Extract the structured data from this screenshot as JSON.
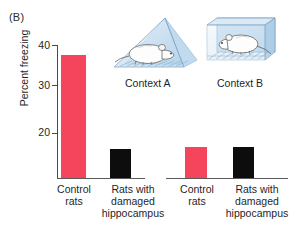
{
  "panel": {
    "label": "(B)"
  },
  "chart_data": {
    "type": "bar",
    "title": "",
    "subtitle": "",
    "xlabel": "",
    "ylabel": "Percent freezing",
    "ylim": [
      14,
      42
    ],
    "yticks": [
      20,
      30,
      40
    ],
    "ytick_labels": [
      "20",
      "30",
      "40"
    ],
    "grid": false,
    "legend": "none",
    "groups": [
      {
        "name": "Context A",
        "label": "Context A"
      },
      {
        "name": "Context B",
        "label": "Context B"
      }
    ],
    "categories": [
      "Control rats",
      "Rats with damaged hippocampus"
    ],
    "series": [
      {
        "name": "Context A",
        "values": [
          40,
          20
        ]
      },
      {
        "name": "Context B",
        "values": [
          20.5,
          20.5
        ]
      }
    ],
    "bar_colors": {
      "control": "#f4455c",
      "lesion": "#0d0d0d"
    },
    "annotations": []
  },
  "axis": {
    "y_title": "Percent freezing",
    "ticks": [
      {
        "value": "40"
      },
      {
        "value": "30"
      },
      {
        "value": "20"
      }
    ]
  },
  "contexts": {
    "a": {
      "label": "Context A",
      "cage_shape": "triangular-prism-cage",
      "animal": "rat"
    },
    "b": {
      "label": "Context B",
      "cage_shape": "rectangular-box-cage",
      "animal": "rat"
    }
  },
  "x_labels": {
    "control": "Control\nrats",
    "lesion": "Rats with\ndamaged\nhippocampus"
  },
  "colors": {
    "control_bar": "#f4455c",
    "lesion_bar": "#0d0d0d",
    "axis": "#4a4a4a",
    "text": "#1f1f1f",
    "cage_glass": "#cfe2f3",
    "cage_edge": "#6f97bb"
  }
}
